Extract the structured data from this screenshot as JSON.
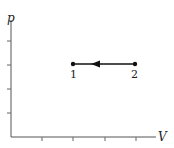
{
  "diagram": {
    "type": "pV-diagram",
    "axes": {
      "y_label": "p",
      "x_label": "V",
      "y_ticks": 4,
      "x_ticks": 4
    },
    "points": [
      {
        "label": "1",
        "x_tick": 2,
        "y_tick": 3
      },
      {
        "label": "2",
        "x_tick": 4,
        "y_tick": 3
      }
    ],
    "process": {
      "from": "2",
      "to": "1",
      "direction": "arrow pointing left (2 to 1)",
      "kind": "isobaric compression"
    }
  },
  "colors": {
    "line": "#222222",
    "background": "#ffffff"
  }
}
